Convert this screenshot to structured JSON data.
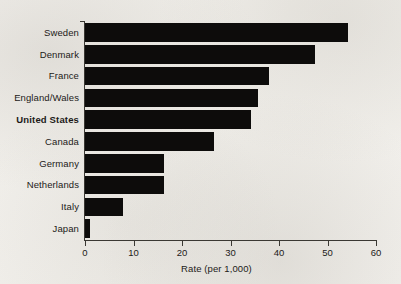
{
  "chart_data": {
    "type": "bar",
    "orientation": "horizontal",
    "title": "",
    "subtitle": "",
    "xlabel": "Rate (per 1,000)",
    "ylabel": "",
    "xlim": [
      0,
      60
    ],
    "xticks": [
      0,
      10,
      20,
      30,
      40,
      50,
      60
    ],
    "xtick_labels": [
      "0",
      "10",
      "20",
      "30",
      "40",
      "50",
      "60"
    ],
    "grid": false,
    "legend": null,
    "bar_color": "#0d0c0b",
    "background_color": "#f2f0ec",
    "axis_color": "#3a3833",
    "highlight_category": "United States",
    "categories": [
      "Sweden",
      "Denmark",
      "France",
      "England/Wales",
      "United States",
      "Canada",
      "Germany",
      "Netherlands",
      "Italy",
      "Japan"
    ],
    "values": [
      54.3,
      47.4,
      38.0,
      35.7,
      34.2,
      26.6,
      16.2,
      16.2,
      7.8,
      1.0
    ],
    "series": [
      {
        "name": "Rate (per 1,000)",
        "values": [
          54.3,
          47.4,
          38.0,
          35.7,
          34.2,
          26.6,
          16.2,
          16.2,
          7.8,
          1.0
        ]
      }
    ],
    "bars": [
      {
        "label": "Sweden",
        "value": 54.3,
        "bold": false
      },
      {
        "label": "Denmark",
        "value": 47.4,
        "bold": false
      },
      {
        "label": "France",
        "value": 38.0,
        "bold": false
      },
      {
        "label": "England/Wales",
        "value": 35.7,
        "bold": false
      },
      {
        "label": "United States",
        "value": 34.2,
        "bold": true
      },
      {
        "label": "Canada",
        "value": 26.6,
        "bold": false
      },
      {
        "label": "Germany",
        "value": 16.2,
        "bold": false
      },
      {
        "label": "Netherlands",
        "value": 16.2,
        "bold": false
      },
      {
        "label": "Italy",
        "value": 7.8,
        "bold": false
      },
      {
        "label": "Japan",
        "value": 1.0,
        "bold": false
      }
    ]
  }
}
